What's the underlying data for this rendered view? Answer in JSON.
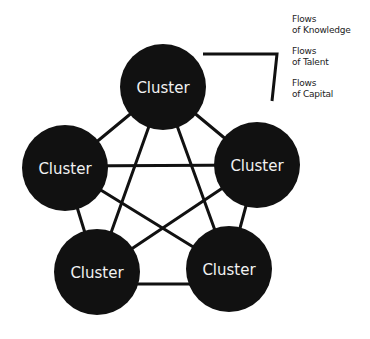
{
  "diagram": {
    "type": "fully-connected network",
    "colors": {
      "node_fill": "#111111",
      "node_text": "#f2f2f2",
      "edge": "#111111",
      "background": "#ffffff"
    },
    "nodes": [
      {
        "id": "top",
        "label": "Cluster",
        "cx": 163,
        "cy": 87,
        "r": 43
      },
      {
        "id": "left",
        "label": "Cluster",
        "cx": 65,
        "cy": 168,
        "r": 43
      },
      {
        "id": "right",
        "label": "Cluster",
        "cx": 257,
        "cy": 165,
        "r": 43
      },
      {
        "id": "bottom-left",
        "label": "Cluster",
        "cx": 97,
        "cy": 272,
        "r": 43
      },
      {
        "id": "bottom-right",
        "label": "Cluster",
        "cx": 229,
        "cy": 269,
        "r": 43
      }
    ],
    "edges": [
      [
        "top",
        "left"
      ],
      [
        "top",
        "right"
      ],
      [
        "top",
        "bottom-left"
      ],
      [
        "top",
        "bottom-right"
      ],
      [
        "left",
        "right"
      ],
      [
        "left",
        "bottom-left"
      ],
      [
        "left",
        "bottom-right"
      ],
      [
        "right",
        "bottom-left"
      ],
      [
        "right",
        "bottom-right"
      ],
      [
        "bottom-left",
        "bottom-right"
      ]
    ]
  },
  "legend": {
    "items": [
      {
        "line1": "Flows",
        "line2": "of Knowledge"
      },
      {
        "line1": "Flows",
        "line2": "of Talent"
      },
      {
        "line1": "Flows",
        "line2": "of Capital"
      }
    ],
    "bracket": {
      "points": "203,54 277,54 272,101"
    }
  }
}
